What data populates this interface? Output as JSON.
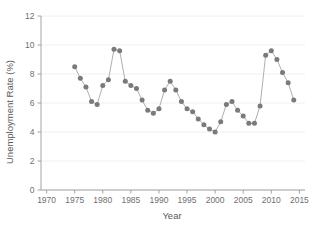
{
  "chart_data": {
    "type": "line",
    "title": "",
    "xlabel": "Year",
    "ylabel": "Unemployment Rate (%)",
    "xlim": [
      1969,
      2016
    ],
    "ylim": [
      0,
      12
    ],
    "xticks": [
      1970,
      1975,
      1980,
      1985,
      1990,
      1995,
      2000,
      2005,
      2010,
      2015
    ],
    "yticks": [
      0,
      2,
      4,
      6,
      8,
      10,
      12
    ],
    "grid": true,
    "legend": null,
    "marker": "circle",
    "marker_color": "#7a7a7a",
    "line_color": "#9b9b9b",
    "x": [
      1975,
      1976,
      1977,
      1978,
      1979,
      1980,
      1981,
      1982,
      1983,
      1984,
      1985,
      1986,
      1987,
      1988,
      1989,
      1990,
      1991,
      1992,
      1993,
      1994,
      1995,
      1996,
      1997,
      1998,
      1999,
      2000,
      2001,
      2002,
      2003,
      2004,
      2005,
      2006,
      2007,
      2008,
      2009,
      2010,
      2011,
      2012,
      2013,
      2014
    ],
    "values": [
      8.5,
      7.7,
      7.1,
      6.1,
      5.9,
      7.2,
      7.6,
      9.7,
      9.6,
      7.5,
      7.2,
      7.0,
      6.2,
      5.5,
      5.3,
      5.6,
      6.9,
      7.5,
      6.9,
      6.1,
      5.6,
      5.4,
      4.9,
      4.5,
      4.2,
      4.0,
      4.7,
      5.9,
      6.1,
      5.5,
      5.1,
      4.6,
      4.6,
      5.8,
      9.3,
      9.6,
      9.0,
      8.1,
      7.4,
      6.2
    ]
  },
  "axis": {
    "y_title": "Unemployment Rate (%)",
    "x_title": "Year"
  }
}
